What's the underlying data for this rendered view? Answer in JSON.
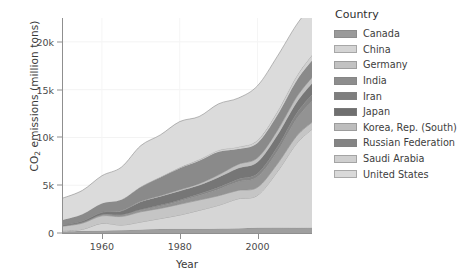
{
  "chart_data": {
    "type": "area",
    "stacked": true,
    "title": "",
    "xlabel": "Year",
    "ylabel": "CO2 emissions (million tons)",
    "ylabel_display": "CO₂ emissions (million tons)",
    "legend_title": "Country",
    "legend_position": "right",
    "grid": true,
    "xlim": [
      1950,
      2014
    ],
    "ylim": [
      0,
      22500
    ],
    "xticks": [
      1960,
      1980,
      2000
    ],
    "xtick_labels": [
      "1960",
      "1980",
      "2000"
    ],
    "yticks": [
      0,
      5000,
      10000,
      15000,
      20000
    ],
    "ytick_labels": [
      "0",
      "5k",
      "10k",
      "15k",
      "20k"
    ],
    "x": [
      1950,
      1955,
      1960,
      1965,
      1970,
      1975,
      1980,
      1985,
      1990,
      1995,
      2000,
      2005,
      2010,
      2014
    ],
    "series": [
      {
        "name": "Canada",
        "color": "#9a9a9a",
        "values": [
          150,
          200,
          230,
          280,
          350,
          410,
          430,
          420,
          450,
          480,
          540,
          560,
          540,
          560
        ]
      },
      {
        "name": "China",
        "color": "#d4d4d4",
        "values": [
          80,
          180,
          780,
          550,
          800,
          1100,
          1450,
          1950,
          2450,
          3100,
          3400,
          5800,
          8800,
          10300
        ]
      },
      {
        "name": "Germany",
        "color": "#c2c2c2",
        "values": [
          480,
          650,
          790,
          890,
          1070,
          1060,
          1130,
          1080,
          1000,
          880,
          840,
          810,
          780,
          720
        ]
      },
      {
        "name": "India",
        "color": "#8d8d8d",
        "values": [
          60,
          90,
          120,
          170,
          200,
          260,
          350,
          480,
          690,
          900,
          1100,
          1300,
          1800,
          2240
        ]
      },
      {
        "name": "Iran",
        "color": "#7e7e7e",
        "values": [
          4,
          9,
          18,
          30,
          50,
          90,
          90,
          140,
          200,
          270,
          350,
          470,
          570,
          650
        ]
      },
      {
        "name": "Japan",
        "color": "#6f6f6f",
        "values": [
          80,
          120,
          230,
          380,
          790,
          900,
          950,
          920,
          1050,
          1150,
          1200,
          1240,
          1150,
          1210
        ]
      },
      {
        "name": "Korea, Rep. (South)",
        "color": "#bdbdbd",
        "values": [
          3,
          7,
          13,
          20,
          55,
          90,
          130,
          170,
          250,
          400,
          440,
          480,
          560,
          600
        ]
      },
      {
        "name": "Russian Federation",
        "color": "#848484",
        "values": [
          500,
          700,
          900,
          1150,
          1500,
          1900,
          2250,
          2400,
          2400,
          1600,
          1550,
          1600,
          1700,
          1760
        ]
      },
      {
        "name": "Saudi Arabia",
        "color": "#cfcfcf",
        "values": [
          3,
          6,
          11,
          18,
          30,
          50,
          80,
          130,
          180,
          230,
          290,
          370,
          480,
          580
        ]
      },
      {
        "name": "United States",
        "color": "#d9d9d9",
        "values": [
          2300,
          2500,
          2900,
          3400,
          4300,
          4400,
          4800,
          4500,
          4850,
          5100,
          5700,
          5800,
          5400,
          5250
        ]
      }
    ]
  },
  "axis": {
    "y_title_main": "O",
    "y_title_prefix": "C",
    "y_title_sub": "2",
    "y_title_rest": " emissions (million tons)",
    "x_title": "Year"
  }
}
